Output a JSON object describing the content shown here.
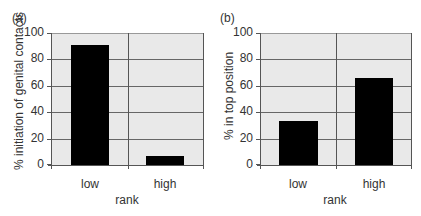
{
  "chart_data": [
    {
      "type": "bar",
      "panel_label": "(a)",
      "title": "",
      "categories": [
        "low",
        "high"
      ],
      "values": [
        91,
        7
      ],
      "xlabel": "rank",
      "ylabel": "% initiation of genital contacts",
      "ylim": [
        0,
        100
      ],
      "yticks": [
        0,
        20,
        40,
        60,
        80,
        100
      ],
      "grid": true,
      "bar_color": "#000000",
      "background_color": "#e9e9e9"
    },
    {
      "type": "bar",
      "panel_label": "(b)",
      "title": "",
      "categories": [
        "low",
        "high"
      ],
      "values": [
        33,
        66
      ],
      "xlabel": "rank",
      "ylabel": "% in top position",
      "ylim": [
        0,
        100
      ],
      "yticks": [
        0,
        20,
        40,
        60,
        80,
        100
      ],
      "grid": true,
      "bar_color": "#000000",
      "background_color": "#e9e9e9"
    }
  ]
}
